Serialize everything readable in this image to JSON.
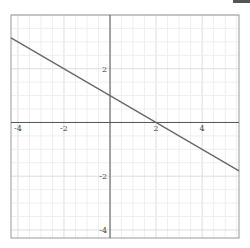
{
  "chart_data": {
    "type": "line",
    "title": "",
    "xlabel": "",
    "ylabel": "",
    "xlim": [
      -4.3,
      5.6
    ],
    "ylim": [
      -4.3,
      4.0
    ],
    "grid": true,
    "x_ticks": [
      -4,
      -2,
      2,
      4
    ],
    "y_ticks": [
      2,
      -2,
      -4
    ],
    "x_tick_labels": [
      "-4",
      "-2",
      "2",
      "4"
    ],
    "y_tick_labels": [
      "2",
      "-2",
      "-4"
    ],
    "series": [
      {
        "name": "y = -0.5x + 1",
        "color": "#666666",
        "x": [
          -4.3,
          5.6
        ],
        "y": [
          3.15,
          -1.8
        ]
      }
    ],
    "key_points": {
      "y_intercept": [
        0,
        1
      ],
      "x_intercept": [
        2,
        0
      ]
    }
  },
  "colors": {
    "axis": "#555555",
    "frame": "#999999",
    "grid_minor": "#eeeeee",
    "grid_major": "#dddddd",
    "line": "#666666"
  }
}
